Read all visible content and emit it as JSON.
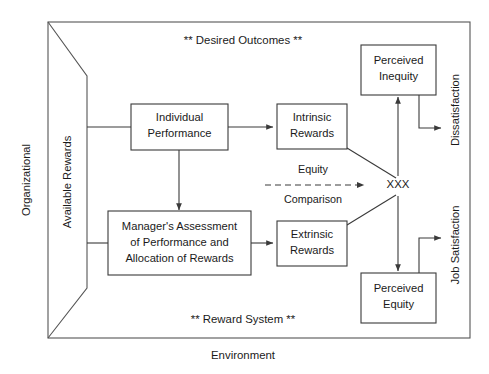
{
  "diagram": {
    "title_top": "** Desired Outcomes **",
    "title_bottom": "** Reward System **",
    "caption": "Environment",
    "outer_left_label": "Organizational",
    "wedge_label": "Available Rewards",
    "right_label_top": "Dissatisfaction",
    "right_label_bottom": "Job Satisfaction",
    "junction_label": "XXX",
    "edge_label_top": "Equity",
    "edge_label_bottom": "Comparison",
    "colors": {
      "stroke": "#3a3a3a",
      "frame": "#555555",
      "text": "#1a1a1a",
      "background": "#ffffff"
    },
    "boxes": {
      "individual_performance": {
        "line1": "Individual",
        "line2": "Performance"
      },
      "managers_assessment": {
        "line1": "Manager's Assessment",
        "line2": "of Performance and",
        "line3": "Allocation of Rewards"
      },
      "intrinsic_rewards": {
        "line1": "Intrinsic",
        "line2": "Rewards"
      },
      "extrinsic_rewards": {
        "line1": "Extrinsic",
        "line2": "Rewards"
      },
      "perceived_inequity": {
        "line1": "Perceived",
        "line2": "Inequity"
      },
      "perceived_equity": {
        "line1": "Perceived",
        "line2": "Equity"
      }
    }
  }
}
